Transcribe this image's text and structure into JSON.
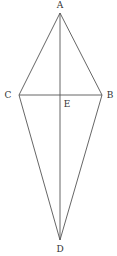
{
  "diagram": {
    "type": "geometry-kite",
    "points": {
      "A": {
        "label": "A",
        "x": 60,
        "y": 13
      },
      "B": {
        "label": "B",
        "x": 102,
        "y": 95
      },
      "C": {
        "label": "C",
        "x": 19,
        "y": 95
      },
      "D": {
        "label": "D",
        "x": 60,
        "y": 240
      },
      "E": {
        "label": "E",
        "x": 60,
        "y": 95
      }
    },
    "segments": [
      "AC",
      "AB",
      "CD",
      "BD",
      "AD",
      "CB"
    ],
    "colors": {
      "line": "#555555",
      "label": "#333333",
      "background": "#ffffff"
    }
  }
}
